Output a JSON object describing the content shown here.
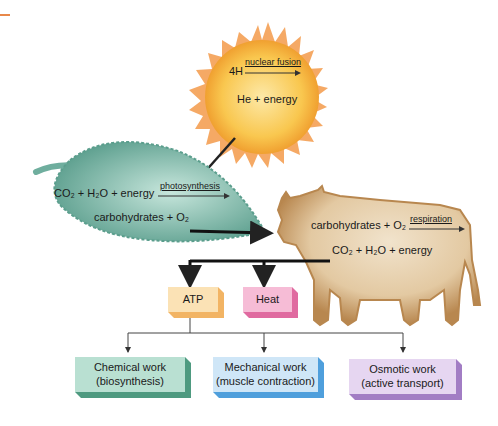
{
  "sun": {
    "reactant": "4H",
    "process": "nuclear fusion",
    "product": "He + energy"
  },
  "leaf": {
    "reactants": "CO₂ + H₂O + energy",
    "process": "photosynthesis",
    "products": "carbohydrates + O₂"
  },
  "cow": {
    "reactants": "carbohydrates + O₂",
    "process": "respiration",
    "products": "CO₂ + H₂O + energy"
  },
  "outputs": {
    "atp": "ATP",
    "heat": "Heat"
  },
  "work": [
    {
      "line1": "Chemical work",
      "line2": "(biosynthesis)"
    },
    {
      "line1": "Mechanical work",
      "line2": "(muscle contraction)"
    },
    {
      "line1": "Osmotic work",
      "line2": "(active transport)"
    }
  ],
  "colors": {
    "sun_core": "#f7b733",
    "sun_rays": "#f39a4a",
    "leaf": "#6fae9e",
    "cow": "#b8874f",
    "atp": "#fbd9a3",
    "heat": "#f3a2c3",
    "chemical": "#8fc9b5",
    "mechanical": "#a9d3f2",
    "osmotic": "#cdb3e0"
  }
}
